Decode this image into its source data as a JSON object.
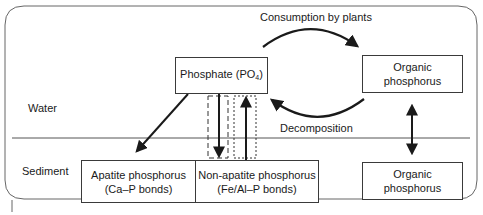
{
  "diagram": {
    "title_labels": {
      "consumption": "Consumption by plants",
      "decomposition": "Decomposition"
    },
    "zones": {
      "water": "Water",
      "sediment": "Sediment"
    },
    "nodes": {
      "phosphate": {
        "text": "Phosphate (PO",
        "subscript": "4",
        "suffix": ")"
      },
      "organic_top": {
        "text": "Organic phosphorus"
      },
      "apatite": {
        "line1": "Apatite phosphorus",
        "line2": "(Ca–P bonds)"
      },
      "non_apatite": {
        "line1": "Non-apatite phosphorus",
        "line2": "(Fe/Al–P bonds)"
      },
      "organic_bottom": {
        "text": "Organic phosphorus"
      }
    },
    "edges": [
      {
        "from": "phosphate",
        "to": "organic_top",
        "label": "Consumption by plants",
        "style": "curved-arrow"
      },
      {
        "from": "organic_top",
        "to": "phosphate",
        "label": "Decomposition",
        "style": "curved-arrow"
      },
      {
        "from": "phosphate",
        "to": "apatite",
        "style": "arrow"
      },
      {
        "from": "phosphate",
        "to": "non_apatite",
        "style": "arrow-in-dashed-box"
      },
      {
        "from": "non_apatite",
        "to": "phosphate",
        "style": "arrow-in-dotted-box"
      },
      {
        "from": "organic_top",
        "to": "organic_bottom",
        "style": "double-arrow"
      }
    ],
    "colors": {
      "stroke": "#1a1a1a",
      "frame": "#555555",
      "background": "#ffffff"
    }
  }
}
